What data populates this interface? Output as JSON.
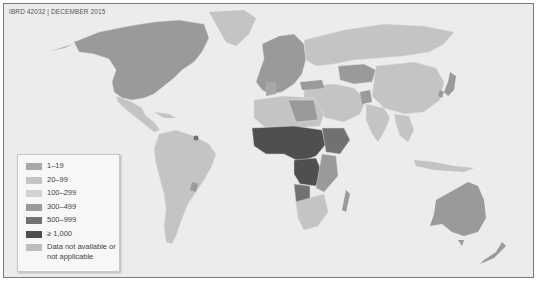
{
  "caption": "IBRD 42032  |  DECEMBER 2015",
  "legend": {
    "items": [
      {
        "label": "1–19",
        "color": "#a8a8a8"
      },
      {
        "label": "20–99",
        "color": "#c4c4c4"
      },
      {
        "label": "100–299",
        "color": "#d2d2d2"
      },
      {
        "label": "300–499",
        "color": "#9a9a9a"
      },
      {
        "label": "500–999",
        "color": "#717171"
      },
      {
        "label": "≥ 1,000",
        "color": "#4f4f4f"
      },
      {
        "label": "Data not available or not applicable",
        "color": "#bdbdbd"
      }
    ]
  },
  "colors": {
    "ocean": "#ececec",
    "border": "#7a7a7a",
    "cat_1_19": "#a8a8a8",
    "cat_20_99": "#c4c4c4",
    "cat_100_299": "#d2d2d2",
    "cat_300_499": "#9a9a9a",
    "cat_500_999": "#717171",
    "cat_1000_plus": "#4f4f4f",
    "cat_na": "#bdbdbd"
  }
}
